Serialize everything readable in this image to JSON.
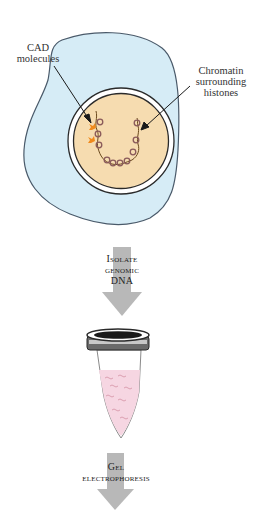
{
  "figure": {
    "labels": {
      "cad_molecules": {
        "line1": "CAD",
        "line2": "molecules"
      },
      "chromatin": {
        "line1": "Chromatin",
        "line2": "surrounding",
        "line3": "histones"
      }
    },
    "steps": [
      {
        "lines": [
          "Isolate",
          "genomic",
          "DNA"
        ]
      },
      {
        "lines": [
          "Gel",
          "electrophoresis"
        ]
      }
    ],
    "colors": {
      "cell_fill": "#d6ecf6",
      "cell_stroke": "#4a5a6a",
      "nucleus_fill": "#f6dcb0",
      "nucleus_ring": "#2a2a2a",
      "chromatin": "#6b4a1e",
      "histone": "#8a5a5a",
      "cad": "#f08a1c",
      "arrow": "#b8b8b8",
      "tube_liquid": "#f6d6e2",
      "tube_dna": "#d89aac",
      "cap": "#3a3a3a"
    }
  }
}
